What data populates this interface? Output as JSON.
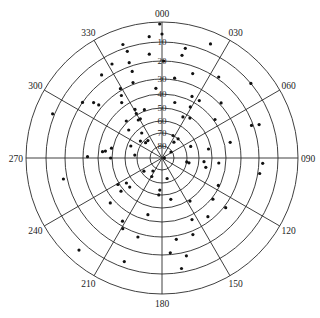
{
  "chart_data": {
    "type": "scatter",
    "subtype": "polar-sky-plot",
    "title": "",
    "angular_axis": {
      "direction": "clockwise",
      "zero": "north",
      "tick_labels": [
        "000",
        "030",
        "060",
        "090",
        "120",
        "150",
        "180",
        "210",
        "240",
        "270",
        "300",
        "330"
      ],
      "tick_degrees": [
        0,
        30,
        60,
        90,
        120,
        150,
        180,
        210,
        240,
        270,
        300,
        330
      ]
    },
    "radial_axis": {
      "label": "elevation",
      "outer": 0,
      "center": 90,
      "tick_labels": [
        "10",
        "20",
        "30",
        "40",
        "50",
        "60",
        "70",
        "80"
      ],
      "rings_elevation": [
        0,
        10,
        20,
        30,
        40,
        50,
        60,
        70,
        80
      ],
      "rings_radius_px": [
        136,
        116,
        97,
        79,
        64,
        50,
        37,
        25,
        12
      ]
    },
    "grid": true,
    "legend": null,
    "points": [
      {
        "az": 23,
        "el": 6
      },
      {
        "az": 12,
        "el": 12
      },
      {
        "az": 11,
        "el": 16
      },
      {
        "az": 20,
        "el": 24
      },
      {
        "az": 35,
        "el": 19
      },
      {
        "az": 9,
        "el": 29
      },
      {
        "az": 50,
        "el": 10
      },
      {
        "az": 26,
        "el": 37
      },
      {
        "az": 33,
        "el": 37
      },
      {
        "az": 13,
        "el": 45
      },
      {
        "az": 47,
        "el": 29
      },
      {
        "az": 29,
        "el": 44
      },
      {
        "az": 27,
        "el": 53
      },
      {
        "az": 35,
        "el": 51
      },
      {
        "az": 54,
        "el": 39
      },
      {
        "az": 70,
        "el": 21
      },
      {
        "az": 71,
        "el": 17
      },
      {
        "az": 77,
        "el": 36
      },
      {
        "az": 26,
        "el": 70
      },
      {
        "az": 40,
        "el": 70
      },
      {
        "az": 37,
        "el": 74
      },
      {
        "az": 68,
        "el": 65
      },
      {
        "az": 79,
        "el": 52
      },
      {
        "az": 56,
        "el": 81
      },
      {
        "az": 0,
        "el": 6
      },
      {
        "az": 1,
        "el": 20
      },
      {
        "az": 359,
        "el": 1
      },
      {
        "az": 354,
        "el": 7
      },
      {
        "az": 341,
        "el": 8
      },
      {
        "az": 342,
        "el": 12
      },
      {
        "az": 353,
        "el": 16
      },
      {
        "az": 332,
        "el": 15
      },
      {
        "az": 341,
        "el": 18
      },
      {
        "az": 324,
        "el": 17
      },
      {
        "az": 341,
        "el": 23
      },
      {
        "az": 339,
        "el": 29
      },
      {
        "az": 329,
        "el": 29
      },
      {
        "az": 355,
        "el": 36
      },
      {
        "az": 327,
        "el": 33
      },
      {
        "az": 305,
        "el": 20
      },
      {
        "az": 309,
        "el": 25
      },
      {
        "az": 310,
        "el": 28
      },
      {
        "az": 324,
        "el": 37
      },
      {
        "az": 292,
        "el": 9
      },
      {
        "az": 331,
        "el": 46
      },
      {
        "az": 330,
        "el": 49
      },
      {
        "az": 340,
        "el": 49
      },
      {
        "az": 328,
        "el": 54
      },
      {
        "az": 316,
        "el": 49
      },
      {
        "az": 331,
        "el": 54
      },
      {
        "az": 310,
        "el": 55
      },
      {
        "az": 321,
        "el": 64
      },
      {
        "az": 308,
        "el": 68
      },
      {
        "az": 321,
        "el": 72
      },
      {
        "az": 291,
        "el": 63
      },
      {
        "az": 313,
        "el": 72
      },
      {
        "az": 276,
        "el": 43
      },
      {
        "az": 277,
        "el": 45
      },
      {
        "az": 281,
        "el": 49
      },
      {
        "az": 271,
        "el": 33
      },
      {
        "az": 270,
        "el": 49
      },
      {
        "az": 276,
        "el": 68
      },
      {
        "az": 258,
        "el": 18
      },
      {
        "az": 239,
        "el": 49
      },
      {
        "az": 235,
        "el": 55
      },
      {
        "az": 228,
        "el": 55
      },
      {
        "az": 231,
        "el": 48
      },
      {
        "az": 215,
        "el": 77
      },
      {
        "az": 184,
        "el": 64
      },
      {
        "az": 185,
        "el": 60
      },
      {
        "az": 229,
        "el": 37
      },
      {
        "az": 194,
        "el": 44
      },
      {
        "az": 212,
        "el": 33
      },
      {
        "az": 209,
        "el": 29
      },
      {
        "az": 197,
        "el": 28
      },
      {
        "az": 222,
        "el": 6
      },
      {
        "az": 200,
        "el": 13
      },
      {
        "az": 234,
        "el": 72
      },
      {
        "az": 209,
        "el": 73
      },
      {
        "az": 99,
        "el": 70
      },
      {
        "az": 100,
        "el": 68
      },
      {
        "az": 95,
        "el": 56
      },
      {
        "az": 102,
        "el": 54
      },
      {
        "az": 95,
        "el": 45
      },
      {
        "az": 93,
        "el": 18
      },
      {
        "az": 99,
        "el": 19
      },
      {
        "az": 166,
        "el": 73
      },
      {
        "az": 116,
        "el": 41
      },
      {
        "az": 168,
        "el": 56
      },
      {
        "az": 147,
        "el": 49
      },
      {
        "az": 129,
        "el": 39
      },
      {
        "az": 128,
        "el": 29
      },
      {
        "az": 154,
        "el": 37
      },
      {
        "az": 142,
        "el": 33
      },
      {
        "az": 158,
        "el": 28
      },
      {
        "az": 170,
        "el": 28
      },
      {
        "az": 175,
        "el": 21
      },
      {
        "az": 166,
        "el": 18
      },
      {
        "az": 170,
        "el": 12
      },
      {
        "az": 90,
        "el": 88
      }
    ]
  }
}
